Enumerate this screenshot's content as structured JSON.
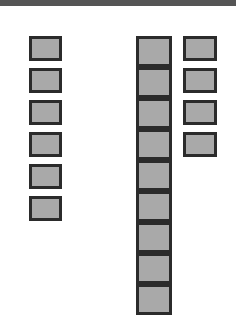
{
  "board": {
    "topbar_color": "#555555",
    "tile_fill": "#a9a9a9",
    "tile_border": "#2b2b2b",
    "columns": [
      {
        "name": "left-stack",
        "x": 29,
        "y": 36,
        "w": 33,
        "h": 25,
        "gap": 32,
        "count": 6
      },
      {
        "name": "center-stack",
        "x": 136,
        "y": 36,
        "w": 36,
        "h": 31,
        "gap": 31,
        "count": 10
      },
      {
        "name": "right-stack",
        "x": 183,
        "y": 36,
        "w": 34,
        "h": 25,
        "gap": 32,
        "count": 4
      }
    ]
  }
}
